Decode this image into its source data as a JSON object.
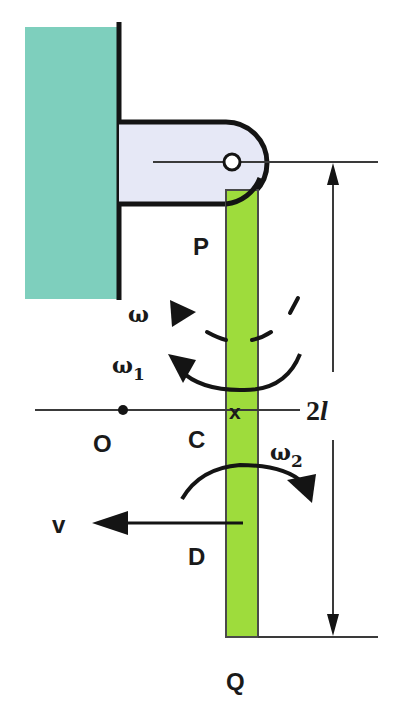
{
  "diagram": {
    "title": "",
    "colors": {
      "wall": "#7ecfbd",
      "bracket": "#e6e8f6",
      "rod": "#9edc3c",
      "ink": "#141414",
      "thin_line": "#3a3a3a"
    },
    "labels": {
      "pivot": "P",
      "omega": "ω",
      "omega1": "ω",
      "omega1_sub": "1",
      "center": "C",
      "center_mark": "x",
      "origin": "O",
      "omega2": "ω",
      "omega2_sub": "2",
      "velocity": "v",
      "point_d": "D",
      "end": "Q",
      "length_num": "2",
      "length_var": "l"
    }
  }
}
